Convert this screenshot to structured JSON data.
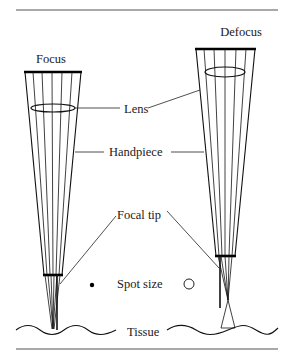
{
  "diagram": {
    "titles": {
      "left": "Focus",
      "right": "Defocus"
    },
    "labels": {
      "lens": "Lens",
      "handpiece": "Handpiece",
      "focal_tip": "Focal tip",
      "spot_size": "Spot size",
      "tissue": "Tissue"
    },
    "spot_sizes": {
      "focus": "small filled dot",
      "defocus": "larger open circle"
    },
    "colors": {
      "line": "#111111",
      "rule": "#555555",
      "background": "#ffffff"
    }
  }
}
